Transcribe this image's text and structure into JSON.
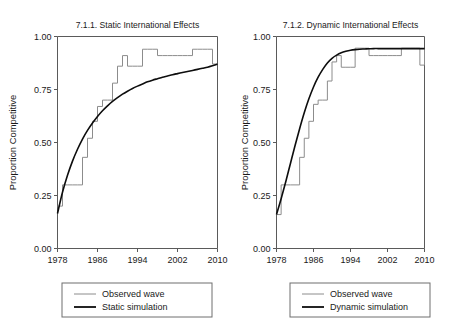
{
  "figure": {
    "ylabel": "Proportion Competitive",
    "background": "#ffffff",
    "observed_color": "#8c8c8c",
    "simulation_color": "#0d0d0d",
    "axis_color": "#5a5a5a"
  },
  "chart_data": [
    {
      "type": "line",
      "panel_id": "left",
      "title": "7.1.1. Static International Effects",
      "xlabel": "",
      "ylabel": "Proportion Competitive",
      "xlim": [
        1978,
        2010
      ],
      "ylim": [
        0.0,
        1.0
      ],
      "xticks": [
        1978,
        1986,
        1994,
        2002,
        2010
      ],
      "xticklabels": [
        "1978",
        "1986",
        "1994",
        "2002",
        "2010"
      ],
      "yticks": [
        0.0,
        0.25,
        0.5,
        0.75,
        1.0
      ],
      "yticklabels": [
        "0.00",
        "0.25",
        "0.50",
        "0.75",
        "1.00"
      ],
      "grid": false,
      "legend_position": "below",
      "series": [
        {
          "name": "Observed wave",
          "color": "#8c8c8c",
          "style": "step",
          "x": [
            1978,
            1979,
            1980,
            1981,
            1982,
            1983,
            1984,
            1985,
            1986,
            1987,
            1988,
            1989,
            1990,
            1991,
            1992,
            1993,
            1994,
            1995,
            1996,
            1997,
            1998,
            1999,
            2000,
            2001,
            2002,
            2003,
            2004,
            2005,
            2006,
            2007,
            2008,
            2009,
            2010
          ],
          "y": [
            0.2,
            0.3,
            0.3,
            0.3,
            0.3,
            0.43,
            0.52,
            0.6,
            0.67,
            0.7,
            0.7,
            0.78,
            0.86,
            0.91,
            0.86,
            0.86,
            0.86,
            0.94,
            0.94,
            0.94,
            0.91,
            0.91,
            0.91,
            0.91,
            0.91,
            0.91,
            0.91,
            0.94,
            0.94,
            0.94,
            0.94,
            0.87,
            0.87
          ]
        },
        {
          "name": "Static simulation",
          "color": "#0d0d0d",
          "style": "smooth",
          "x": [
            1978,
            1979,
            1980,
            1981,
            1982,
            1983,
            1984,
            1985,
            1986,
            1987,
            1988,
            1989,
            1990,
            1991,
            1992,
            1993,
            1994,
            1995,
            1996,
            1997,
            1998,
            1999,
            2000,
            2001,
            2002,
            2003,
            2004,
            2005,
            2006,
            2007,
            2008,
            2009,
            2010
          ],
          "y": [
            0.165,
            0.265,
            0.345,
            0.412,
            0.468,
            0.516,
            0.557,
            0.592,
            0.623,
            0.65,
            0.673,
            0.694,
            0.712,
            0.728,
            0.742,
            0.755,
            0.766,
            0.776,
            0.786,
            0.794,
            0.801,
            0.808,
            0.814,
            0.82,
            0.825,
            0.83,
            0.835,
            0.84,
            0.845,
            0.85,
            0.855,
            0.862,
            0.87
          ]
        }
      ],
      "legend": [
        {
          "label": "Observed wave",
          "color": "#8c8c8c",
          "width": 1
        },
        {
          "label": "Static simulation",
          "color": "#0d0d0d",
          "width": 1.8
        }
      ]
    },
    {
      "type": "line",
      "panel_id": "right",
      "title": "7.1.2. Dynamic International Effects",
      "xlabel": "",
      "ylabel": "Proportion Competitive",
      "xlim": [
        1978,
        2010
      ],
      "ylim": [
        0.0,
        1.0
      ],
      "xticks": [
        1978,
        1986,
        1994,
        2002,
        2010
      ],
      "xticklabels": [
        "1978",
        "1986",
        "1994",
        "2002",
        "2010"
      ],
      "yticks": [
        0.0,
        0.25,
        0.5,
        0.75,
        1.0
      ],
      "yticklabels": [
        "0.00",
        "0.25",
        "0.50",
        "0.75",
        "1.00"
      ],
      "grid": false,
      "legend_position": "below",
      "series": [
        {
          "name": "Observed wave",
          "color": "#8c8c8c",
          "style": "step",
          "x": [
            1978,
            1979,
            1980,
            1981,
            1982,
            1983,
            1984,
            1985,
            1986,
            1987,
            1988,
            1989,
            1990,
            1991,
            1992,
            1993,
            1994,
            1995,
            1996,
            1997,
            1998,
            1999,
            2000,
            2001,
            2002,
            2003,
            2004,
            2005,
            2006,
            2007,
            2008,
            2009,
            2010
          ],
          "y": [
            0.16,
            0.3,
            0.3,
            0.3,
            0.3,
            0.43,
            0.52,
            0.6,
            0.68,
            0.7,
            0.7,
            0.79,
            0.88,
            0.91,
            0.855,
            0.855,
            0.855,
            0.945,
            0.945,
            0.945,
            0.91,
            0.91,
            0.91,
            0.91,
            0.91,
            0.91,
            0.91,
            0.945,
            0.945,
            0.945,
            0.945,
            0.865,
            0.94
          ]
        },
        {
          "name": "Dynamic simulation",
          "color": "#0d0d0d",
          "style": "smooth",
          "x": [
            1978,
            1979,
            1980,
            1981,
            1982,
            1983,
            1984,
            1985,
            1986,
            1987,
            1988,
            1989,
            1990,
            1991,
            1992,
            1993,
            1994,
            1995,
            1996,
            1997,
            1998,
            1999,
            2000,
            2001,
            2002,
            2003,
            2004,
            2005,
            2006,
            2007,
            2008,
            2009,
            2010
          ],
          "y": [
            0.16,
            0.235,
            0.315,
            0.4,
            0.485,
            0.565,
            0.64,
            0.706,
            0.762,
            0.808,
            0.845,
            0.875,
            0.897,
            0.912,
            0.923,
            0.93,
            0.935,
            0.938,
            0.94,
            0.941,
            0.942,
            0.943,
            0.943,
            0.943,
            0.943,
            0.943,
            0.943,
            0.943,
            0.943,
            0.943,
            0.943,
            0.943,
            0.943
          ]
        }
      ],
      "legend": [
        {
          "label": "Observed wave",
          "color": "#8c8c8c",
          "width": 1
        },
        {
          "label": "Dynamic simulation",
          "color": "#0d0d0d",
          "width": 1.8
        }
      ]
    }
  ]
}
